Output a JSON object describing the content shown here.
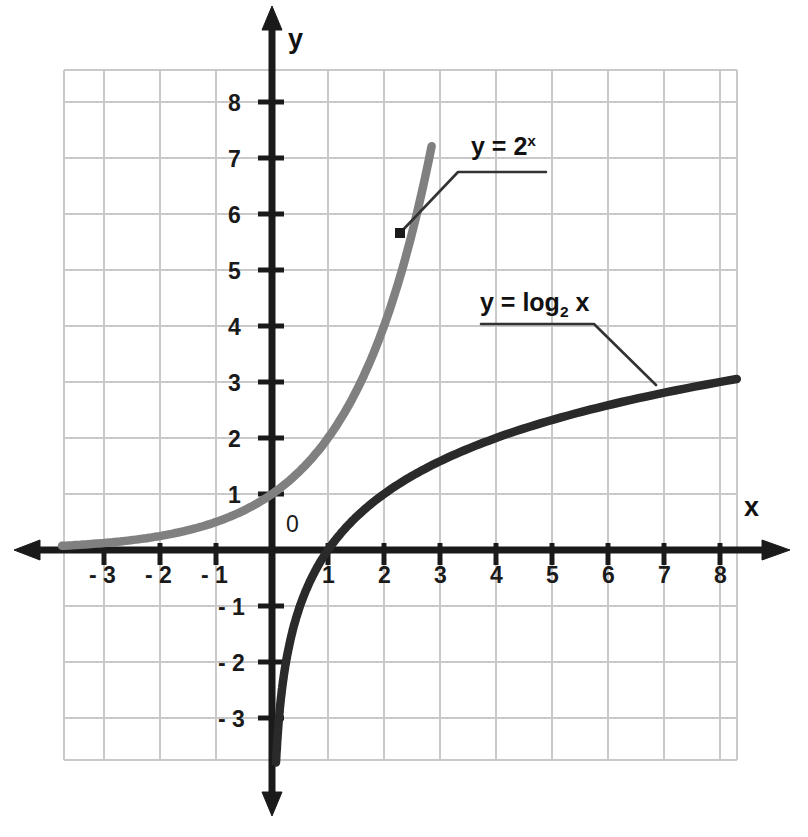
{
  "chart_data": {
    "type": "line",
    "title": "",
    "xlabel": "x",
    "ylabel": "y",
    "xlim": [
      -3.75,
      8.3
    ],
    "ylim": [
      -3.75,
      8.55
    ],
    "grid": true,
    "grid_spacing": 1,
    "legend_position": "inline-annotations",
    "origin_label": "0",
    "x_ticks": [
      -3,
      -2,
      -1,
      1,
      2,
      3,
      4,
      5,
      6,
      7,
      8
    ],
    "x_tick_labels": [
      "- 3",
      "- 2",
      "- 1",
      "1",
      "2",
      "3",
      "4",
      "5",
      "6",
      "7",
      "8"
    ],
    "y_ticks": [
      -3,
      -2,
      -1,
      1,
      2,
      3,
      4,
      5,
      6,
      7,
      8
    ],
    "y_tick_labels": [
      "- 3",
      "- 2",
      "- 1",
      "1",
      "2",
      "3",
      "4",
      "5",
      "6",
      "7",
      "8"
    ],
    "series": [
      {
        "name": "y = 2^x",
        "label_text": "y = 2",
        "label_sup": "x",
        "label_sub": "",
        "color": "#808080",
        "function": "2^x",
        "x": [
          -3.75,
          -3.5,
          -3,
          -2.5,
          -2,
          -1.5,
          -1,
          -0.5,
          0,
          0.5,
          1,
          1.5,
          2,
          2.5,
          2.85
        ],
        "values": [
          0.074,
          0.088,
          0.125,
          0.177,
          0.25,
          0.354,
          0.5,
          0.707,
          1,
          1.414,
          2,
          2.828,
          4,
          5.657,
          7.21
        ],
        "annotation_point": [
          2.3,
          5.67
        ]
      },
      {
        "name": "y = log2 x",
        "label_text": "y = log",
        "label_sup": "",
        "label_sub": "2",
        "label_tail": " x",
        "color": "#2a2a2a",
        "function": "log2(x)",
        "x": [
          0.072,
          0.09,
          0.125,
          0.18,
          0.25,
          0.35,
          0.5,
          0.71,
          1,
          1.41,
          2,
          2.83,
          4,
          5.66,
          8,
          8.3
        ],
        "values": [
          -3.8,
          -3.47,
          -3,
          -2.47,
          -2,
          -1.51,
          -1,
          -0.49,
          0,
          0.5,
          1,
          1.5,
          2,
          2.5,
          3,
          3.05
        ],
        "annotation_point": [
          7.3,
          2.93
        ]
      }
    ]
  },
  "axes": {
    "x_axis_name": "x",
    "y_axis_name": "y",
    "x_arrow": "arrow-right",
    "y_arrow_up": "arrow-up",
    "y_arrow_down": "arrow-down"
  },
  "colors": {
    "grid": "#c9c9c9",
    "axis": "#1a1a1a",
    "exponential": "#808080",
    "logarithmic": "#2a2a2a",
    "leader": "#333333",
    "background": "#ffffff"
  }
}
